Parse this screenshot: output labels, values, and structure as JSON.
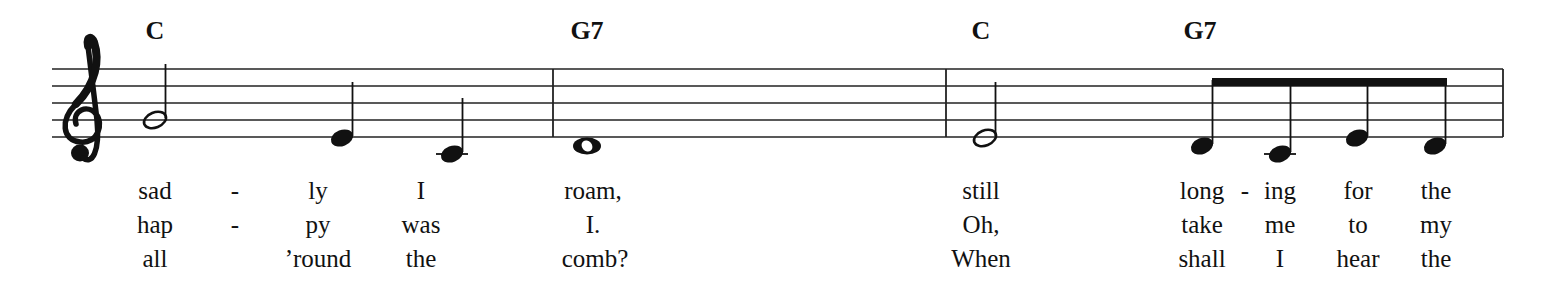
{
  "score": {
    "clef": "treble",
    "staff": {
      "x_start": 52,
      "x_end": 1503,
      "lines_y": [
        69,
        86,
        103,
        120,
        137
      ],
      "color": "#222222"
    },
    "barlines_x": [
      553,
      946,
      1503
    ],
    "chords": [
      {
        "label": "C",
        "x": 155
      },
      {
        "label": "G7",
        "x": 587
      },
      {
        "label": "C",
        "x": 981
      },
      {
        "label": "G7",
        "x": 1200
      }
    ],
    "notes": [
      {
        "pitch": "G4",
        "duration": "half",
        "x": 155,
        "y": 120,
        "stem": "up",
        "ledger": false
      },
      {
        "pitch": "E4",
        "duration": "quarter",
        "x": 342,
        "y": 138,
        "stem": "up",
        "ledger": false
      },
      {
        "pitch": "C4",
        "duration": "quarter",
        "x": 452,
        "y": 154,
        "stem": "up",
        "ledger": true
      },
      {
        "pitch": "D4",
        "duration": "whole",
        "x": 587,
        "y": 146,
        "stem": "none",
        "ledger": false
      },
      {
        "pitch": "E4",
        "duration": "half",
        "x": 985,
        "y": 138,
        "stem": "up",
        "ledger": false
      },
      {
        "pitch": "D4",
        "duration": "eighth",
        "x": 1202,
        "y": 146,
        "stem": "up",
        "ledger": false,
        "beam_group": 1
      },
      {
        "pitch": "C4",
        "duration": "eighth",
        "x": 1280,
        "y": 154,
        "stem": "up",
        "ledger": true,
        "beam_group": 1
      },
      {
        "pitch": "E4",
        "duration": "eighth",
        "x": 1357,
        "y": 138,
        "stem": "up",
        "ledger": false,
        "beam_group": 1
      },
      {
        "pitch": "D4",
        "duration": "eighth",
        "x": 1435,
        "y": 146,
        "stem": "up",
        "ledger": false,
        "beam_group": 1
      }
    ],
    "beams": [
      {
        "group": 1,
        "x1": 1212,
        "x2": 1447,
        "y": 80,
        "thickness": 8
      }
    ],
    "lyrics": {
      "row_y": [
        178,
        212,
        246
      ],
      "verses": [
        [
          {
            "text": "sad",
            "x": 155
          },
          {
            "text": "-",
            "x": 235
          },
          {
            "text": "ly",
            "x": 318
          },
          {
            "text": "I",
            "x": 421
          },
          {
            "text": "roam,",
            "x": 593
          },
          {
            "text": "still",
            "x": 981
          },
          {
            "text": "long",
            "x": 1202
          },
          {
            "text": "-",
            "x": 1245
          },
          {
            "text": "ing",
            "x": 1280
          },
          {
            "text": "for",
            "x": 1358
          },
          {
            "text": "the",
            "x": 1436
          }
        ],
        [
          {
            "text": "hap",
            "x": 155
          },
          {
            "text": "-",
            "x": 235
          },
          {
            "text": "py",
            "x": 318
          },
          {
            "text": "was",
            "x": 421
          },
          {
            "text": "I.",
            "x": 593
          },
          {
            "text": "Oh,",
            "x": 981
          },
          {
            "text": "take",
            "x": 1202
          },
          {
            "text": "me",
            "x": 1280
          },
          {
            "text": "to",
            "x": 1358
          },
          {
            "text": "my",
            "x": 1436
          }
        ],
        [
          {
            "text": "all",
            "x": 155
          },
          {
            "text": "’round",
            "x": 318
          },
          {
            "text": "the",
            "x": 421
          },
          {
            "text": "comb?",
            "x": 595
          },
          {
            "text": "When",
            "x": 981
          },
          {
            "text": "shall",
            "x": 1202
          },
          {
            "text": "I",
            "x": 1280
          },
          {
            "text": "hear",
            "x": 1358
          },
          {
            "text": "the",
            "x": 1436
          }
        ]
      ]
    }
  }
}
